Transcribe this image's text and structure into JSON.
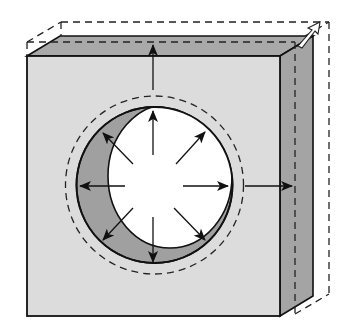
{
  "colors": {
    "background": "#ffffff",
    "front_face": "#dcdcdc",
    "top_face": "#a9a9a9",
    "side_face": "#a4a4a4",
    "hole_shadow": "#a0a0a0",
    "hole_opening": "#ffffff",
    "stroke": "#111111"
  },
  "plate": {
    "front": {
      "x": 27,
      "y": 56,
      "w": 253,
      "h": 260
    },
    "depth": {
      "dx": 33,
      "dy": -20
    }
  },
  "expanded_outline": {
    "front": {
      "x": 27,
      "y": 42,
      "w": 268,
      "h": 272
    },
    "depth": {
      "dx": 34,
      "dy": -20
    }
  },
  "hole": {
    "cx": 154.5,
    "cy": 185,
    "r": 78,
    "expanded_r": 89,
    "opening": {
      "cx": 170,
      "cy": 176,
      "rx": 62,
      "ry": 72
    }
  },
  "arrows": {
    "inner": [
      {
        "name": "up",
        "x1": 153,
        "y1": 155,
        "x2": 153,
        "y2": 111
      },
      {
        "name": "up-right",
        "x1": 176,
        "y1": 164,
        "x2": 205,
        "y2": 132
      },
      {
        "name": "right",
        "x1": 183,
        "y1": 186,
        "x2": 228,
        "y2": 186
      },
      {
        "name": "down-right",
        "x1": 174,
        "y1": 208,
        "x2": 205,
        "y2": 240
      },
      {
        "name": "down",
        "x1": 153,
        "y1": 217,
        "x2": 153,
        "y2": 262
      },
      {
        "name": "down-left",
        "x1": 133,
        "y1": 208,
        "x2": 103,
        "y2": 240
      },
      {
        "name": "left",
        "x1": 125,
        "y1": 186,
        "x2": 80,
        "y2": 186
      },
      {
        "name": "up-left",
        "x1": 133,
        "y1": 164,
        "x2": 103,
        "y2": 133
      }
    ],
    "outer": [
      {
        "name": "outer-up",
        "x1": 153,
        "y1": 90,
        "x2": 153,
        "y2": 45
      },
      {
        "name": "outer-right",
        "x1": 245,
        "y1": 186,
        "x2": 292,
        "y2": 186
      }
    ]
  }
}
